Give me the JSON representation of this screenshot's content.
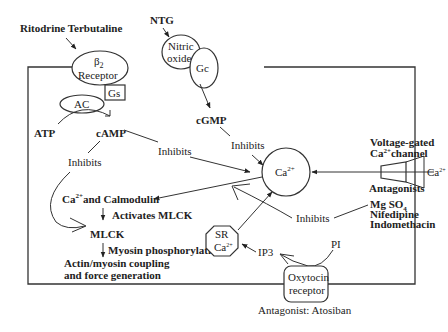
{
  "drugs": {
    "beta_agonists": "Ritodrine Terbutaline",
    "ntg": "NTG"
  },
  "nodes": {
    "beta2_receptor_line1": "β",
    "beta2_receptor_sub": "2",
    "beta2_receptor_line2": "Receptor",
    "nitric_oxide_line1": "Nitric",
    "nitric_oxide_line2": "oxide",
    "gc": "Gc",
    "gs": "Gs",
    "ac": "AC",
    "atp": "ATP",
    "camp": "cAMP",
    "cgmp": "cGMP",
    "ca_center": "Ca",
    "ca_center_sup": "2+",
    "ca_calmodulin_ca": "Ca",
    "ca_calmodulin_sup": "2+",
    "ca_calmodulin_rest": "and Calmodulin",
    "mlck": "MLCK",
    "actin_line1": "Actin/myosin coupling",
    "actin_line2": "and force generation",
    "sr_line1": "SR",
    "sr_line2": "Ca",
    "sr_sup": "2+",
    "ip3": "IP3",
    "pi": "PI",
    "oxytocin_line1": "Oxytocin",
    "oxytocin_line2": "receptor"
  },
  "labels": {
    "inhibits_camp_left": "Inhibits",
    "inhibits_camp_mid": "Inhibits",
    "inhibits_cgmp": "Inhibits",
    "inhibits_lower": "Inhibits",
    "activates_mlck": "Activates MLCK",
    "myosin_phosphorylation": "Myosin phosphorylation",
    "vg_channel_line1": "Voltage-gated",
    "vg_channel_ca": "Ca",
    "vg_channel_sup": "2+",
    "vg_channel_rest": "channel",
    "extracellular_ca": "Ca",
    "extracellular_ca_sup": "2+",
    "antagonists": "Antagonists",
    "mgso4_mg": "Mg SO",
    "mgso4_sub": "4",
    "nifedipine": "Nifedipine",
    "indomethacin": "Indomethacin",
    "antagonist_atosiban": "Antagonist: Atosiban"
  }
}
